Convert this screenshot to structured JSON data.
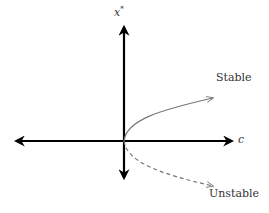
{
  "diagram": {
    "type": "bifurcation-diagram",
    "axes": {
      "y_label": "x",
      "y_label_superscript": "*",
      "x_label": "c"
    },
    "branches": [
      {
        "label": "Stable",
        "style": "solid",
        "color": "#777777"
      },
      {
        "label": "Unstable",
        "style": "dashed",
        "color": "#777777"
      }
    ],
    "axis_color": "#000000"
  }
}
